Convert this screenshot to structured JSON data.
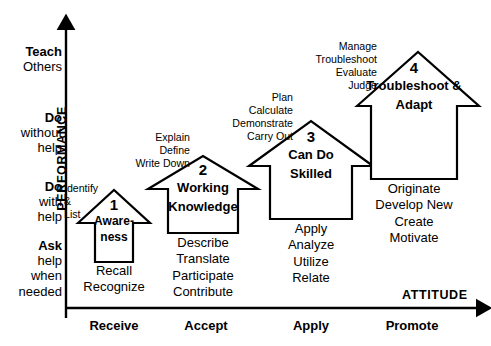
{
  "diagram": {
    "axes": {
      "y_name": "PERFORMANCE",
      "x_name": "ATTITUDE",
      "y_levels": [
        {
          "bold": "Teach",
          "rest": "Others"
        },
        {
          "bold": "Do",
          "rest": "without\nhelp"
        },
        {
          "bold": "Do",
          "rest": "with\nhelp"
        },
        {
          "bold": "Ask",
          "rest": "help\nwhen\nneeded"
        }
      ],
      "x_levels": [
        "Receive",
        "Accept",
        "Apply",
        "Promote"
      ]
    },
    "stages": [
      {
        "number": "1",
        "name": "Aware-\nness",
        "verbs_above": "Identify\n&\nList",
        "verbs_below": "Recall\nRecognize"
      },
      {
        "number": "2",
        "name": "Working\nKnowledge",
        "verbs_above": "Explain\nDefine\nWrite Down",
        "verbs_below": "Describe\nTranslate\nParticipate\nContribute"
      },
      {
        "number": "3",
        "name": "Can Do\nSkilled",
        "verbs_above": "Plan\nCalculate\nDemonstrate\nCarry Out",
        "verbs_below": "Apply\nAnalyze\nUtilize\nRelate"
      },
      {
        "number": "4",
        "name": "Troubleshoot\n&\nAdapt",
        "verbs_above": "Manage\nTroubleshoot\nEvaluate\nJudge",
        "verbs_below": "Originate\nDevelop New\nCreate\nMotivate"
      }
    ],
    "colors": {
      "stroke": "#000000",
      "background": "#ffffff",
      "text": "#000000"
    }
  }
}
